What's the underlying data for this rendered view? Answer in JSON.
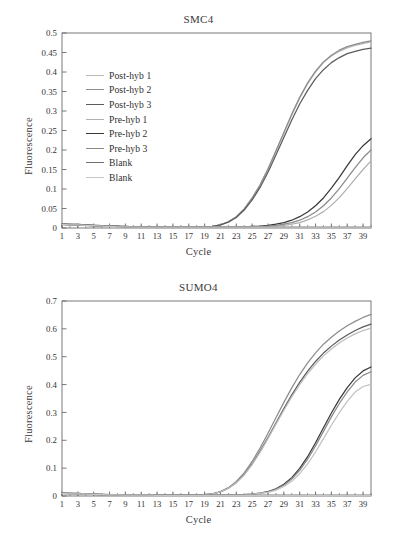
{
  "figure": {
    "panels": [
      "smc4",
      "sumo4"
    ]
  },
  "smc4": {
    "title": "SMC4",
    "xlabel": "Cycle",
    "ylabel": "Fluorescence",
    "legend": [
      {
        "label": "Post-hyb 1",
        "color": "#b9b9b9"
      },
      {
        "label": "Post-hyb 2",
        "color": "#8d8d8d"
      },
      {
        "label": "Post-hyb 3",
        "color": "#5c5c5c"
      },
      {
        "label": "Pre-hyb 1",
        "color": "#b0b0b0"
      },
      {
        "label": "Pre-hyb 2",
        "color": "#3a3a3a"
      },
      {
        "label": "Pre-hyb 3",
        "color": "#8a8a8a"
      },
      {
        "label": "Blank",
        "color": "#6f6f6f"
      },
      {
        "label": "Blank",
        "color": "#c6c6c6"
      }
    ]
  },
  "sumo4": {
    "title": "SUMO4",
    "xlabel": "Cycle",
    "ylabel": "Fluorescence"
  },
  "chart_data": [
    {
      "type": "line",
      "title": "SMC4",
      "xlabel": "Cycle",
      "ylabel": "Fluorescence",
      "xlim": [
        1,
        40
      ],
      "ylim": [
        0,
        0.5
      ],
      "ytick_step": 0.05,
      "yticks": [
        0,
        0.05,
        0.1,
        0.15,
        0.2,
        0.25,
        0.3,
        0.35,
        0.4,
        0.45,
        0.5
      ],
      "ytick_labels": [
        "0",
        "0.05",
        "0.1",
        "0.15",
        "0.2",
        "0.25",
        "0.3",
        "0.35",
        "0.4",
        "0.45",
        "0.5"
      ],
      "xticks": [
        1,
        3,
        5,
        7,
        9,
        11,
        13,
        15,
        17,
        19,
        21,
        23,
        25,
        27,
        29,
        31,
        33,
        35,
        37,
        39
      ],
      "xtick_labels": [
        "1",
        "3",
        "5",
        "7",
        "9",
        "11",
        "13",
        "15",
        "17",
        "19",
        "21",
        "23",
        "25",
        "27",
        "29",
        "31",
        "33",
        "35",
        "37",
        "39"
      ],
      "minor_xticks_every": 1,
      "grid": false,
      "legend_position": "upper-left-inside",
      "x": [
        1,
        2,
        3,
        4,
        5,
        6,
        7,
        8,
        9,
        10,
        11,
        12,
        13,
        14,
        15,
        16,
        17,
        18,
        19,
        20,
        21,
        22,
        23,
        24,
        25,
        26,
        27,
        28,
        29,
        30,
        31,
        32,
        33,
        34,
        35,
        36,
        37,
        38,
        39,
        40
      ],
      "series": [
        {
          "name": "Post-hyb 1",
          "color": "#b9b9b9",
          "values": [
            0.01,
            0.009,
            0.009,
            0.008,
            0.007,
            0.006,
            0.005,
            0.004,
            0.004,
            0.003,
            0.003,
            0.003,
            0.002,
            0.002,
            0.002,
            0.002,
            0.002,
            0.002,
            0.003,
            0.004,
            0.008,
            0.016,
            0.029,
            0.049,
            0.076,
            0.11,
            0.15,
            0.196,
            0.243,
            0.29,
            0.333,
            0.37,
            0.4,
            0.424,
            0.441,
            0.453,
            0.462,
            0.468,
            0.473,
            0.477
          ]
        },
        {
          "name": "Post-hyb 2",
          "color": "#8d8d8d",
          "values": [
            0.01,
            0.009,
            0.009,
            0.008,
            0.007,
            0.006,
            0.005,
            0.004,
            0.004,
            0.003,
            0.003,
            0.003,
            0.002,
            0.002,
            0.002,
            0.002,
            0.002,
            0.002,
            0.003,
            0.004,
            0.008,
            0.016,
            0.029,
            0.049,
            0.077,
            0.111,
            0.152,
            0.198,
            0.245,
            0.292,
            0.335,
            0.372,
            0.402,
            0.426,
            0.443,
            0.456,
            0.465,
            0.471,
            0.476,
            0.48
          ]
        },
        {
          "name": "Post-hyb 3",
          "color": "#5c5c5c",
          "values": [
            0.01,
            0.009,
            0.009,
            0.008,
            0.007,
            0.006,
            0.005,
            0.004,
            0.004,
            0.003,
            0.003,
            0.003,
            0.002,
            0.002,
            0.002,
            0.002,
            0.002,
            0.002,
            0.003,
            0.004,
            0.008,
            0.015,
            0.027,
            0.046,
            0.072,
            0.104,
            0.143,
            0.187,
            0.232,
            0.277,
            0.318,
            0.353,
            0.383,
            0.406,
            0.424,
            0.437,
            0.447,
            0.453,
            0.458,
            0.461
          ]
        },
        {
          "name": "Pre-hyb 1",
          "color": "#b0b0b0",
          "values": [
            0.009,
            0.008,
            0.008,
            0.007,
            0.006,
            0.005,
            0.004,
            0.004,
            0.003,
            0.003,
            0.002,
            0.002,
            0.002,
            0.002,
            0.002,
            0.002,
            0.002,
            0.002,
            0.002,
            0.002,
            0.002,
            0.002,
            0.002,
            0.002,
            0.003,
            0.003,
            0.004,
            0.005,
            0.007,
            0.01,
            0.014,
            0.021,
            0.03,
            0.042,
            0.058,
            0.078,
            0.101,
            0.126,
            0.15,
            0.172
          ]
        },
        {
          "name": "Pre-hyb 2",
          "color": "#3a3a3a",
          "values": [
            0.009,
            0.008,
            0.008,
            0.007,
            0.006,
            0.005,
            0.004,
            0.004,
            0.003,
            0.003,
            0.002,
            0.002,
            0.002,
            0.002,
            0.002,
            0.002,
            0.002,
            0.002,
            0.002,
            0.002,
            0.002,
            0.002,
            0.003,
            0.003,
            0.004,
            0.005,
            0.007,
            0.01,
            0.014,
            0.02,
            0.029,
            0.041,
            0.057,
            0.077,
            0.102,
            0.13,
            0.16,
            0.188,
            0.211,
            0.229
          ]
        },
        {
          "name": "Pre-hyb 3",
          "color": "#8a8a8a",
          "values": [
            0.009,
            0.008,
            0.008,
            0.007,
            0.006,
            0.005,
            0.004,
            0.004,
            0.003,
            0.003,
            0.002,
            0.002,
            0.002,
            0.002,
            0.002,
            0.002,
            0.002,
            0.002,
            0.002,
            0.002,
            0.002,
            0.002,
            0.002,
            0.003,
            0.003,
            0.004,
            0.005,
            0.007,
            0.01,
            0.014,
            0.02,
            0.029,
            0.041,
            0.057,
            0.077,
            0.101,
            0.128,
            0.155,
            0.18,
            0.2
          ]
        },
        {
          "name": "Blank",
          "color": "#6f6f6f",
          "values": [
            0.01,
            0.009,
            0.008,
            0.007,
            0.006,
            0.005,
            0.004,
            0.004,
            0.003,
            0.003,
            0.002,
            0.002,
            0.002,
            0.002,
            0.002,
            0.002,
            0.002,
            0.002,
            0.002,
            0.002,
            0.002,
            0.002,
            0.002,
            0.002,
            0.002,
            0.002,
            0.002,
            0.002,
            0.002,
            0.002,
            0.002,
            0.002,
            0.002,
            0.002,
            0.002,
            0.002,
            0.002,
            0.002,
            0.002,
            0.002
          ]
        },
        {
          "name": "Blank",
          "color": "#c6c6c6",
          "values": [
            0.009,
            0.008,
            0.008,
            0.007,
            0.006,
            0.005,
            0.004,
            0.003,
            0.003,
            0.002,
            0.002,
            0.002,
            0.002,
            0.002,
            0.002,
            0.002,
            0.002,
            0.002,
            0.002,
            0.002,
            0.002,
            0.002,
            0.002,
            0.002,
            0.002,
            0.002,
            0.002,
            0.002,
            0.002,
            0.002,
            0.002,
            0.002,
            0.002,
            0.002,
            0.002,
            0.002,
            0.002,
            0.002,
            0.002,
            0.002
          ]
        }
      ]
    },
    {
      "type": "line",
      "title": "SUMO4",
      "xlabel": "Cycle",
      "ylabel": "Fluorescence",
      "xlim": [
        1,
        40
      ],
      "ylim": [
        0,
        0.7
      ],
      "ytick_step": 0.1,
      "yticks": [
        0,
        0.1,
        0.2,
        0.3,
        0.4,
        0.5,
        0.6,
        0.7
      ],
      "ytick_labels": [
        "0",
        "0.1",
        "0.2",
        "0.3",
        "0.4",
        "0.5",
        "0.6",
        "0.7"
      ],
      "xticks": [
        1,
        3,
        5,
        7,
        9,
        11,
        13,
        15,
        17,
        19,
        21,
        23,
        25,
        27,
        29,
        31,
        33,
        35,
        37,
        39
      ],
      "xtick_labels": [
        "1",
        "3",
        "5",
        "7",
        "9",
        "11",
        "13",
        "15",
        "17",
        "19",
        "21",
        "23",
        "25",
        "27",
        "29",
        "31",
        "33",
        "35",
        "37",
        "39"
      ],
      "minor_xticks_every": 1,
      "grid": false,
      "legend_position": "none",
      "x": [
        1,
        2,
        3,
        4,
        5,
        6,
        7,
        8,
        9,
        10,
        11,
        12,
        13,
        14,
        15,
        16,
        17,
        18,
        19,
        20,
        21,
        22,
        23,
        24,
        25,
        26,
        27,
        28,
        29,
        30,
        31,
        32,
        33,
        34,
        35,
        36,
        37,
        38,
        39,
        40
      ],
      "series": [
        {
          "name": "Post-hyb 1",
          "color": "#8d8d8d",
          "values": [
            0.01,
            0.009,
            0.009,
            0.008,
            0.007,
            0.006,
            0.005,
            0.005,
            0.004,
            0.004,
            0.003,
            0.003,
            0.003,
            0.003,
            0.003,
            0.003,
            0.003,
            0.004,
            0.005,
            0.008,
            0.016,
            0.03,
            0.052,
            0.083,
            0.124,
            0.172,
            0.225,
            0.281,
            0.336,
            0.388,
            0.436,
            0.478,
            0.514,
            0.545,
            0.57,
            0.592,
            0.611,
            0.627,
            0.641,
            0.652
          ]
        },
        {
          "name": "Post-hyb 2",
          "color": "#5c5c5c",
          "values": [
            0.01,
            0.009,
            0.009,
            0.008,
            0.007,
            0.006,
            0.005,
            0.005,
            0.004,
            0.004,
            0.003,
            0.003,
            0.003,
            0.003,
            0.003,
            0.003,
            0.003,
            0.004,
            0.005,
            0.008,
            0.015,
            0.028,
            0.048,
            0.077,
            0.115,
            0.16,
            0.21,
            0.262,
            0.314,
            0.363,
            0.408,
            0.448,
            0.483,
            0.513,
            0.538,
            0.56,
            0.578,
            0.594,
            0.607,
            0.617
          ]
        },
        {
          "name": "Post-hyb 3",
          "color": "#bdbdbd",
          "values": [
            0.01,
            0.009,
            0.009,
            0.008,
            0.007,
            0.006,
            0.005,
            0.005,
            0.004,
            0.004,
            0.003,
            0.003,
            0.003,
            0.003,
            0.003,
            0.003,
            0.003,
            0.004,
            0.005,
            0.008,
            0.015,
            0.028,
            0.048,
            0.076,
            0.113,
            0.157,
            0.206,
            0.257,
            0.308,
            0.356,
            0.4,
            0.439,
            0.473,
            0.503,
            0.528,
            0.549,
            0.567,
            0.582,
            0.594,
            0.603
          ]
        },
        {
          "name": "Pre-hyb 1",
          "color": "#3a3a3a",
          "values": [
            0.009,
            0.008,
            0.008,
            0.007,
            0.006,
            0.005,
            0.004,
            0.004,
            0.003,
            0.003,
            0.003,
            0.003,
            0.002,
            0.002,
            0.002,
            0.002,
            0.002,
            0.002,
            0.002,
            0.002,
            0.003,
            0.003,
            0.004,
            0.005,
            0.007,
            0.01,
            0.016,
            0.026,
            0.042,
            0.066,
            0.099,
            0.141,
            0.191,
            0.245,
            0.298,
            0.347,
            0.389,
            0.424,
            0.449,
            0.463
          ]
        },
        {
          "name": "Pre-hyb 2",
          "color": "#8a8a8a",
          "values": [
            0.009,
            0.008,
            0.008,
            0.007,
            0.006,
            0.005,
            0.004,
            0.004,
            0.003,
            0.003,
            0.003,
            0.003,
            0.002,
            0.002,
            0.002,
            0.002,
            0.002,
            0.002,
            0.002,
            0.002,
            0.003,
            0.003,
            0.004,
            0.005,
            0.007,
            0.01,
            0.015,
            0.024,
            0.039,
            0.061,
            0.092,
            0.132,
            0.18,
            0.232,
            0.284,
            0.332,
            0.374,
            0.409,
            0.433,
            0.446
          ]
        },
        {
          "name": "Pre-hyb 3",
          "color": "#c2c2c2",
          "values": [
            0.009,
            0.008,
            0.008,
            0.007,
            0.006,
            0.005,
            0.004,
            0.004,
            0.003,
            0.003,
            0.003,
            0.003,
            0.002,
            0.002,
            0.002,
            0.002,
            0.002,
            0.002,
            0.002,
            0.002,
            0.002,
            0.003,
            0.003,
            0.004,
            0.006,
            0.009,
            0.013,
            0.021,
            0.034,
            0.053,
            0.08,
            0.115,
            0.158,
            0.206,
            0.254,
            0.299,
            0.34,
            0.373,
            0.393,
            0.401
          ]
        },
        {
          "name": "Blank",
          "color": "#6f6f6f",
          "values": [
            0.01,
            0.009,
            0.008,
            0.007,
            0.006,
            0.005,
            0.005,
            0.004,
            0.004,
            0.003,
            0.003,
            0.003,
            0.003,
            0.003,
            0.003,
            0.003,
            0.003,
            0.003,
            0.003,
            0.003,
            0.003,
            0.003,
            0.003,
            0.003,
            0.003,
            0.003,
            0.003,
            0.003,
            0.003,
            0.003,
            0.003,
            0.003,
            0.003,
            0.003,
            0.003,
            0.003,
            0.003,
            0.003,
            0.003,
            0.003
          ]
        },
        {
          "name": "Blank",
          "color": "#c6c6c6",
          "values": [
            0.009,
            0.008,
            0.008,
            0.007,
            0.006,
            0.005,
            0.004,
            0.004,
            0.003,
            0.003,
            0.003,
            0.003,
            0.002,
            0.002,
            0.002,
            0.002,
            0.002,
            0.002,
            0.002,
            0.002,
            0.002,
            0.002,
            0.002,
            0.002,
            0.002,
            0.002,
            0.002,
            0.002,
            0.002,
            0.002,
            0.002,
            0.002,
            0.002,
            0.002,
            0.002,
            0.002,
            0.002,
            0.002,
            0.002,
            0.002
          ]
        }
      ]
    }
  ]
}
